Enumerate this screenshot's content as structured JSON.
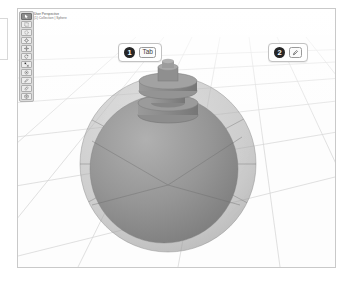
{
  "app": {
    "name": "3D viewport",
    "background_color": "#ffffff",
    "frame_border_color": "#c9c9c9"
  },
  "viewport": {
    "info_line_1": "User Perspective",
    "info_line_2": "(1) Collection | Sphere",
    "grid_color": "#d4d4d4",
    "floor_color": "#fdfdfd"
  },
  "toolbar": {
    "name": "tool-shelf",
    "items": [
      {
        "id": "tweak",
        "label": "Tweak",
        "icon": "cursor-icon",
        "active": true
      },
      {
        "id": "select-box",
        "label": "Select Box",
        "icon": "box-select-icon",
        "active": false
      },
      {
        "id": "select-circle",
        "label": "Select Circle",
        "icon": "circle-select-icon",
        "active": false
      },
      {
        "id": "cursor",
        "label": "Cursor",
        "icon": "crosshair-icon",
        "active": false
      },
      {
        "id": "move",
        "label": "Move",
        "icon": "move-icon",
        "active": false
      },
      {
        "id": "rotate",
        "label": "Rotate",
        "icon": "rotate-icon",
        "active": false
      },
      {
        "id": "scale",
        "label": "Scale",
        "icon": "scale-icon",
        "active": false
      },
      {
        "id": "transform",
        "label": "Transform",
        "icon": "transform-icon",
        "active": false
      },
      {
        "id": "annotate",
        "label": "Annotate",
        "icon": "pencil-icon",
        "active": false
      },
      {
        "id": "measure",
        "label": "Measure",
        "icon": "ruler-icon",
        "active": false
      },
      {
        "id": "add-cube",
        "label": "Add Cube",
        "icon": "cube-add-icon",
        "active": false
      }
    ]
  },
  "callouts": [
    {
      "step": "1",
      "key_label": "Tab",
      "key_type": "text",
      "badge_color": "#262626"
    },
    {
      "step": "2",
      "key_label": "",
      "key_type": "icon",
      "key_icon": "pencil-icon",
      "badge_color": "#262626"
    }
  ],
  "scene": {
    "object_name": "sphere-with-stem",
    "outer_sphere": {
      "label": "outer transparent sphere",
      "fill": "#a8a8a8",
      "opacity": 0.55,
      "cx": 150,
      "cy": 155,
      "r": 88
    },
    "inner_sphere": {
      "label": "inner solid sphere",
      "fill": "#8e8e8e",
      "opacity": 0.95,
      "cx": 146,
      "cy": 160,
      "r": 74
    },
    "stem": {
      "label": "cylindrical stem on top",
      "fill": "#8a8a8a"
    }
  }
}
